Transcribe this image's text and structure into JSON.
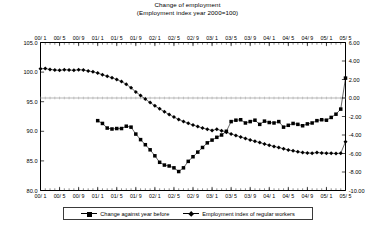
{
  "chart_data": {
    "type": "line",
    "title": "Change of employment",
    "subtitle": "(Employment index year 2000=100)",
    "xlabel": "",
    "ylabel": "",
    "grid": false,
    "legend_position": "bottom",
    "x_axis_position": "top",
    "x_tick_labels": [
      "00/ 1",
      "00/ 5",
      "00/ 9",
      "01/ 1",
      "01/ 5",
      "01/ 9",
      "02/ 1",
      "02/ 5",
      "02/ 9",
      "03/ 1",
      "03/ 5",
      "03/ 9",
      "04/ 1",
      "04/ 5",
      "04/ 9",
      "05/ 1",
      "05/ 5"
    ],
    "x_tick_values": [
      0,
      4,
      8,
      12,
      16,
      20,
      24,
      28,
      32,
      36,
      40,
      44,
      48,
      52,
      56,
      60,
      64
    ],
    "x_range": [
      0,
      64
    ],
    "left_axis": {
      "name": "Employment index of regular workers",
      "tick_labels": [
        "105.0",
        "100.0",
        "95.0",
        "90.0",
        "85.0",
        "80.0"
      ],
      "tick_values": [
        105.0,
        100.0,
        95.0,
        90.0,
        85.0,
        80.0
      ],
      "ylim": [
        80.0,
        105.0
      ]
    },
    "right_axis": {
      "name": "Change against year before",
      "tick_labels": [
        "6.00",
        "4.00",
        "2.00",
        "0.00",
        "-2.00",
        "-4.00",
        "-6.00",
        "-8.00",
        "-10.00"
      ],
      "tick_values": [
        6.0,
        4.0,
        2.0,
        0.0,
        -2.0,
        -4.0,
        -6.0,
        -8.0,
        -10.0
      ],
      "ylim": [
        -10.0,
        6.0
      ]
    },
    "series": [
      {
        "name": "Change against year before",
        "marker": "square",
        "axis": "right",
        "x": [
          12,
          13,
          14,
          15,
          16,
          17,
          18,
          19,
          20,
          21,
          22,
          23,
          24,
          25,
          26,
          27,
          28,
          29,
          30,
          31,
          32,
          33,
          34,
          35,
          36,
          37,
          38,
          39,
          40,
          41,
          42,
          43,
          44,
          45,
          46,
          47,
          48,
          49,
          50,
          51,
          52,
          53,
          54,
          55,
          56,
          57,
          58,
          59,
          60,
          61,
          62,
          63,
          64
        ],
        "values": [
          -2.45,
          -2.75,
          -3.25,
          -3.35,
          -3.3,
          -3.3,
          -3.05,
          -3.15,
          -3.9,
          -4.5,
          -5.05,
          -5.6,
          -6.25,
          -6.95,
          -7.25,
          -7.35,
          -7.55,
          -7.95,
          -7.55,
          -6.85,
          -6.35,
          -5.85,
          -5.35,
          -4.85,
          -4.55,
          -4.25,
          -4.0,
          -3.6,
          -2.55,
          -2.4,
          -2.35,
          -2.7,
          -2.55,
          -2.4,
          -2.85,
          -2.5,
          -2.65,
          -2.7,
          -2.55,
          -3.15,
          -2.95,
          -2.75,
          -2.85,
          -3.0,
          -2.8,
          -2.7,
          -2.45,
          -2.35,
          -2.4,
          -2.1,
          -1.75,
          -1.2,
          2.15
        ]
      },
      {
        "name": "Employment index of regular workers",
        "marker": "diamond",
        "axis": "left",
        "x": [
          0,
          1,
          2,
          3,
          4,
          5,
          6,
          7,
          8,
          9,
          10,
          11,
          12,
          13,
          14,
          15,
          16,
          17,
          18,
          19,
          20,
          21,
          22,
          23,
          24,
          25,
          26,
          27,
          28,
          29,
          30,
          31,
          32,
          33,
          34,
          35,
          36,
          37,
          38,
          39,
          40,
          41,
          42,
          43,
          44,
          45,
          46,
          47,
          48,
          49,
          50,
          51,
          52,
          53,
          54,
          55,
          56,
          57,
          58,
          59,
          60,
          61,
          62,
          63,
          64
        ],
        "values": [
          100.55,
          100.6,
          100.45,
          100.35,
          100.3,
          100.4,
          100.35,
          100.3,
          100.4,
          100.35,
          100.2,
          100.05,
          99.85,
          99.55,
          99.3,
          99.05,
          98.75,
          98.4,
          97.95,
          97.35,
          96.65,
          96.05,
          95.45,
          94.85,
          94.3,
          93.8,
          93.3,
          92.85,
          92.4,
          92.0,
          91.65,
          91.35,
          91.05,
          90.8,
          90.55,
          90.35,
          90.15,
          90.35,
          90.1,
          89.85,
          89.55,
          89.3,
          89.05,
          88.8,
          88.55,
          88.3,
          88.1,
          87.85,
          87.65,
          87.45,
          87.25,
          87.05,
          86.85,
          86.7,
          86.55,
          86.4,
          86.35,
          86.3,
          86.4,
          86.35,
          86.3,
          86.3,
          86.25,
          86.3,
          88.25
        ]
      }
    ]
  },
  "legend": {
    "items": [
      {
        "label": "Change against year before",
        "marker": "square"
      },
      {
        "label": "Employment index of regular workers",
        "marker": "diamond"
      }
    ]
  }
}
